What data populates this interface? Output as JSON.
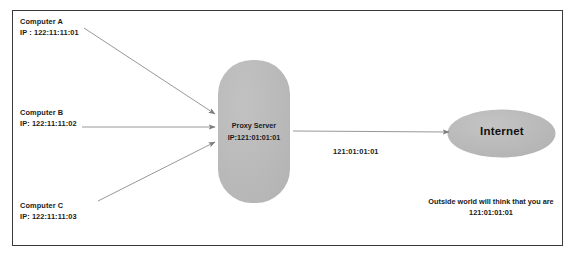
{
  "diagram": {
    "frame": {
      "border_color": "#3a3a3a",
      "background": "#ffffff"
    },
    "shape_fill": "#b8b8b8",
    "arrow_color": "#808080",
    "clients": [
      {
        "id": "computer-a",
        "name": "Computer A",
        "ip": "IP : 122:11:11:01"
      },
      {
        "id": "computer-b",
        "name": "Computer B",
        "ip": "IP: 122:11:11:02"
      },
      {
        "id": "computer-c",
        "name": "Computer C",
        "ip": "IP: 122:11:11:03"
      }
    ],
    "proxy": {
      "name": "Proxy Server",
      "ip": "IP:121:01:01:01"
    },
    "link": {
      "label": "121:01:01:01"
    },
    "internet": {
      "label": "Internet"
    },
    "caption": {
      "line1": "Outside world will think that you are",
      "line2": "121:01:01:01"
    }
  }
}
